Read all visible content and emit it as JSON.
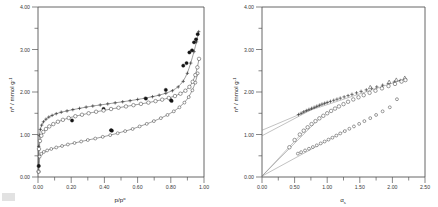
{
  "figure": {
    "name": "nitrogen-adsorption-isotherms-and-alpha-s-plots",
    "panel_count": 2,
    "background_color": "#ffffff",
    "axis_color": "#555555",
    "marker_colors": {
      "open": "#ffffff",
      "filled": "#141414",
      "stroke": "#3a3a3a"
    }
  },
  "chart_data": [
    {
      "type": "scatter",
      "panel": "left",
      "title": "",
      "xlabel": "p/p°",
      "ylabel": "nᵃ / mmol g⁻¹",
      "ylabel_base": "n",
      "ylabel_sup": "a",
      "ylabel_rest": "/ mmol g",
      "ylabel_rest_sup": "-1",
      "xlabel_base": "p/p",
      "xlabel_sup": "o",
      "xlim": [
        0.0,
        1.0
      ],
      "ylim": [
        0.0,
        4.0
      ],
      "xticks": [
        "0.00",
        "0.20",
        "0.40",
        "0.60",
        "0.80",
        "1.00"
      ],
      "xtick_values": [
        0.0,
        0.2,
        0.4,
        0.6,
        0.8,
        1.0
      ],
      "yticks": [
        "0.00",
        "1.00",
        "2.00",
        "3.00",
        "4.00"
      ],
      "ytick_values": [
        0.0,
        1.0,
        2.0,
        3.0,
        4.0
      ],
      "grid": false,
      "legend": "none",
      "series": [
        {
          "name": "sample-A-adsorption",
          "marker": "plus",
          "x": [
            0.002,
            0.004,
            0.008,
            0.014,
            0.022,
            0.033,
            0.048,
            0.065,
            0.085,
            0.11,
            0.14,
            0.175,
            0.21,
            0.25,
            0.29,
            0.33,
            0.375,
            0.42,
            0.465,
            0.51,
            0.555,
            0.6,
            0.645,
            0.69,
            0.73,
            0.77,
            0.81,
            0.845,
            0.875,
            0.9,
            0.92,
            0.94,
            0.955,
            0.968
          ],
          "y": [
            0.255,
            0.72,
            0.98,
            1.12,
            1.22,
            1.3,
            1.36,
            1.41,
            1.45,
            1.49,
            1.525,
            1.555,
            1.585,
            1.615,
            1.645,
            1.67,
            1.695,
            1.72,
            1.745,
            1.77,
            1.795,
            1.825,
            1.855,
            1.89,
            1.925,
            1.97,
            2.03,
            2.12,
            2.25,
            2.44,
            2.68,
            2.95,
            3.18,
            3.42
          ]
        },
        {
          "name": "sample-A-desorption",
          "marker": "filled-circle",
          "x": [
            0.005,
            0.205,
            0.395,
            0.44,
            0.65,
            0.77,
            0.8,
            0.875,
            0.895,
            0.912,
            0.928,
            0.94,
            0.952,
            0.962
          ],
          "y": [
            0.26,
            1.33,
            1.6,
            1.1,
            1.845,
            2.05,
            1.81,
            2.62,
            2.68,
            2.93,
            2.98,
            3.17,
            3.24,
            3.36
          ]
        },
        {
          "name": "sample-B-adsorption",
          "marker": "open-circle",
          "x": [
            0.003,
            0.006,
            0.012,
            0.02,
            0.032,
            0.048,
            0.068,
            0.092,
            0.12,
            0.15,
            0.185,
            0.225,
            0.265,
            0.305,
            0.35,
            0.395,
            0.44,
            0.485,
            0.53,
            0.575,
            0.62,
            0.665,
            0.708,
            0.748,
            0.788,
            0.825,
            0.858,
            0.888,
            0.912,
            0.932,
            0.948,
            0.96,
            0.97
          ],
          "y": [
            0.13,
            0.66,
            0.85,
            0.97,
            1.06,
            1.13,
            1.19,
            1.245,
            1.3,
            1.345,
            1.39,
            1.43,
            1.465,
            1.5,
            1.535,
            1.565,
            1.6,
            1.63,
            1.66,
            1.69,
            1.72,
            1.75,
            1.785,
            1.82,
            1.86,
            1.905,
            1.96,
            2.03,
            2.12,
            2.24,
            2.4,
            2.58,
            2.78
          ]
        },
        {
          "name": "sample-C-adsorption",
          "marker": "open-circle-small",
          "x": [
            0.004,
            0.01,
            0.02,
            0.035,
            0.055,
            0.08,
            0.11,
            0.145,
            0.18,
            0.22,
            0.26,
            0.3,
            0.345,
            0.39,
            0.435,
            0.48,
            0.525,
            0.57,
            0.612,
            0.655,
            0.698,
            0.74,
            0.78,
            0.818,
            0.852,
            0.882,
            0.908,
            0.93,
            0.948,
            0.962
          ],
          "y": [
            0.12,
            0.48,
            0.545,
            0.59,
            0.625,
            0.66,
            0.695,
            0.73,
            0.765,
            0.8,
            0.835,
            0.87,
            0.905,
            0.945,
            0.985,
            1.03,
            1.08,
            1.13,
            1.19,
            1.25,
            1.315,
            1.385,
            1.46,
            1.545,
            1.64,
            1.75,
            1.88,
            2.04,
            2.22,
            2.44
          ]
        },
        {
          "name": "sample-C-desorption",
          "marker": "filled-circle",
          "x": [
            0.445,
            0.805
          ],
          "y": [
            1.09,
            1.79
          ]
        }
      ]
    },
    {
      "type": "scatter",
      "panel": "right",
      "title": "",
      "xlabel": "αₛ",
      "ylabel": "nᵃ / mmol g⁻¹",
      "ylabel_base": "n",
      "ylabel_sup": "a",
      "ylabel_rest": "/ mmol g",
      "ylabel_rest_sup": "-1",
      "xlabel_base": "α",
      "xlabel_sub": "s",
      "xlim": [
        0.0,
        2.5
      ],
      "ylim": [
        0.0,
        4.0
      ],
      "xticks": [
        "0.00",
        "0.50",
        "1.00",
        "1.50",
        "2.00",
        "2.50"
      ],
      "xtick_values": [
        0.0,
        0.5,
        1.0,
        1.5,
        2.0,
        2.5
      ],
      "yticks": [
        "0.00",
        "1.00",
        "2.00",
        "3.00",
        "4.00"
      ],
      "ytick_values": [
        0.0,
        1.0,
        2.0,
        3.0,
        4.0
      ],
      "grid": false,
      "legend": "none",
      "series": [
        {
          "name": "alpha-s-sample-A",
          "marker": "plus",
          "x": [
            0.56,
            0.6,
            0.64,
            0.68,
            0.72,
            0.76,
            0.8,
            0.84,
            0.88,
            0.92,
            0.96,
            1.0,
            1.05,
            1.1,
            1.15,
            1.2,
            1.26,
            1.32,
            1.38,
            1.45,
            1.52,
            1.6,
            1.68,
            1.76,
            1.85,
            1.94,
            2.03,
            2.12,
            2.2
          ],
          "y": [
            1.47,
            1.5,
            1.535,
            1.565,
            1.59,
            1.615,
            1.64,
            1.665,
            1.69,
            1.715,
            1.735,
            1.755,
            1.78,
            1.805,
            1.83,
            1.855,
            1.885,
            1.915,
            1.945,
            1.98,
            2.015,
            2.05,
            2.085,
            2.12,
            2.16,
            2.2,
            2.235,
            2.27,
            2.3
          ]
        },
        {
          "name": "alpha-s-sample-A-high",
          "marker": "triangle",
          "x": [
            1.66,
            1.95,
            2.06,
            2.19
          ],
          "y": [
            2.11,
            2.235,
            2.285,
            2.33
          ]
        },
        {
          "name": "alpha-s-sample-B",
          "marker": "open-circle",
          "x": [
            0.42,
            0.5,
            0.58,
            0.64,
            0.7,
            0.76,
            0.82,
            0.88,
            0.94,
            1.0,
            1.06,
            1.12,
            1.18,
            1.25,
            1.32,
            1.4,
            1.48,
            1.56,
            1.65,
            1.74,
            1.84,
            1.94,
            2.04,
            2.14,
            2.2
          ],
          "y": [
            0.7,
            0.87,
            1.0,
            1.09,
            1.17,
            1.245,
            1.315,
            1.38,
            1.44,
            1.5,
            1.555,
            1.61,
            1.66,
            1.715,
            1.77,
            1.825,
            1.875,
            1.925,
            1.98,
            2.03,
            2.085,
            2.14,
            2.19,
            2.245,
            2.28
          ]
        },
        {
          "name": "alpha-s-sample-C",
          "marker": "open-circle-small",
          "x": [
            0.55,
            0.6,
            0.66,
            0.72,
            0.78,
            0.84,
            0.9,
            0.96,
            1.02,
            1.08,
            1.14,
            1.2,
            1.27,
            1.34,
            1.41,
            1.49,
            1.57,
            1.66,
            1.75,
            1.85,
            1.96,
            2.07
          ],
          "y": [
            0.55,
            0.585,
            0.625,
            0.665,
            0.705,
            0.745,
            0.79,
            0.835,
            0.88,
            0.925,
            0.975,
            1.025,
            1.08,
            1.135,
            1.19,
            1.25,
            1.315,
            1.385,
            1.46,
            1.545,
            1.64,
            1.83
          ]
        }
      ],
      "fit_lines": [
        {
          "name": "fit-line-upper-intercept",
          "x0": 0.0,
          "y0": 1.1,
          "x1": 1.05,
          "y1": 1.78
        },
        {
          "name": "fit-line-mid-intercept",
          "x0": 0.0,
          "y0": 0.97,
          "x1": 0.9,
          "y1": 1.7
        },
        {
          "name": "fit-line-origin-a",
          "x0": 0.0,
          "y0": 0.02,
          "x1": 0.92,
          "y1": 1.44
        },
        {
          "name": "fit-line-origin-b",
          "x0": 0.0,
          "y0": 0.02,
          "x1": 0.7,
          "y1": 1.17
        },
        {
          "name": "fit-line-origin-c",
          "x0": 0.0,
          "y0": 0.02,
          "x1": 1.3,
          "y1": 1.11
        },
        {
          "name": "fit-line-slope-upper",
          "x0": 0.6,
          "y0": 1.5,
          "x1": 2.22,
          "y1": 2.32
        }
      ]
    }
  ]
}
